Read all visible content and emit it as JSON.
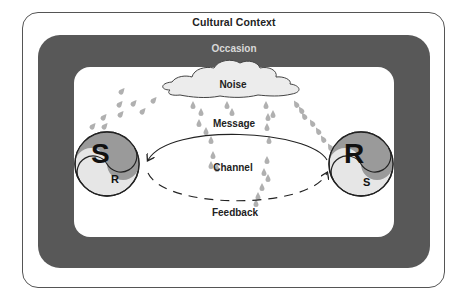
{
  "diagram": {
    "title": "Cultural Context",
    "band_label": "Occasion",
    "noise_label": "Noise",
    "message_label": "Message",
    "channel_label": "Channel",
    "feedback_label": "Feedback",
    "sender": {
      "big_letter": "S",
      "small_letter": "R"
    },
    "receiver": {
      "big_letter": "R",
      "small_letter": "S"
    },
    "colors": {
      "band": "#585858",
      "band_text": "#d8d8d8",
      "cloud_fill": "#ececec",
      "drop": "#b0b0b0",
      "yin_dark": "#9a9a9a",
      "yin_light": "#e6e6e6"
    }
  }
}
